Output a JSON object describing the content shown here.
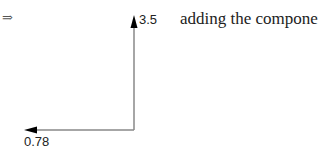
{
  "symbol": "⇒",
  "caption": "adding the components",
  "vectors": {
    "vertical": {
      "label": "3.5",
      "direction": "up"
    },
    "horizontal": {
      "label": "0.78",
      "direction": "left"
    }
  },
  "colors": {
    "line": "#888888",
    "arrowhead": "#000000",
    "text": "#222222"
  }
}
